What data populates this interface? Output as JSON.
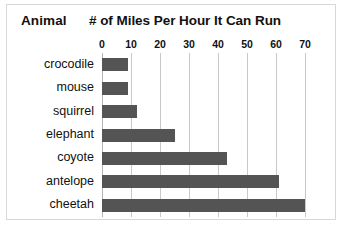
{
  "card": {
    "border_color": "#d8d8d8",
    "background": "#ffffff"
  },
  "header": {
    "category_header": "Animal",
    "value_header": "# of Miles Per Hour It Can Run"
  },
  "chart_data": {
    "type": "bar",
    "orientation": "horizontal",
    "title": "# of Miles Per Hour It Can Run",
    "xlabel": "",
    "ylabel": "Animal",
    "categories": [
      "crocodile",
      "mouse",
      "squirrel",
      "elephant",
      "coyote",
      "antelope",
      "cheetah"
    ],
    "values": [
      9,
      9,
      12,
      25,
      43,
      61,
      70
    ],
    "xlim": [
      0,
      70
    ],
    "ticks": [
      0,
      10,
      20,
      30,
      40,
      50,
      60,
      70
    ],
    "tick_labels": [
      "0",
      "10",
      "20",
      "30",
      "40",
      "50",
      "60",
      "70"
    ],
    "grid": true,
    "legend": "none",
    "bar_color": "#545454",
    "gridline_color": "#c9c9c9",
    "axis_color": "#b4b4b4"
  }
}
